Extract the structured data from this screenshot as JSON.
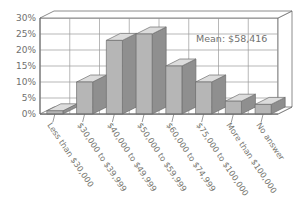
{
  "chart_data": {
    "type": "bar",
    "title": "",
    "subtitle": "",
    "xlabel": "",
    "ylabel": "",
    "grid": true,
    "legend": null,
    "three_d": true,
    "ylim": [
      0,
      30
    ],
    "ytick_labels": [
      "0%",
      "5%",
      "10%",
      "15%",
      "20%",
      "25%",
      "30%"
    ],
    "ytick_values": [
      0,
      5,
      10,
      15,
      20,
      25,
      30
    ],
    "categories": [
      "Less than $30,000",
      "$30,000 to $39,999",
      "$40,000 to $49,999",
      "$50,000 to $59,999",
      "$60,000 to $74,999",
      "$75,000 to $100,000",
      "More than $100,000",
      "No answer"
    ],
    "values": [
      1,
      10,
      23,
      25,
      15,
      10,
      4,
      3
    ],
    "annotations": [
      {
        "text": "Mean: $58,416",
        "x_frac": 0.72,
        "y_value": 22
      }
    ],
    "colors": {
      "bar_front": "#b6b6b6",
      "bar_side": "#8f8f8f",
      "bar_top": "#dcdcdc",
      "bar_outline": "#6e6e6e",
      "grid": "#9a9a9a",
      "axis": "#6e6e6e",
      "plot_background": "#ffffff",
      "wall_back": "#ffffff",
      "text": "#70706e"
    }
  },
  "annotation": {
    "mean_text": "Mean: $58,416"
  },
  "axis": {
    "y_ticks": [
      "30%",
      "25%",
      "20%",
      "15%",
      "10%",
      "5%",
      "0%"
    ]
  },
  "categories": {
    "c0": "Less than $30,000",
    "c1": "$30,000 to $39,999",
    "c2": "$40,000 to $49,999",
    "c3": "$50,000 to $59,999",
    "c4": "$60,000 to $74,999",
    "c5": "$75,000 to $100,000",
    "c6": "More than $100,000",
    "c7": "No answer"
  }
}
